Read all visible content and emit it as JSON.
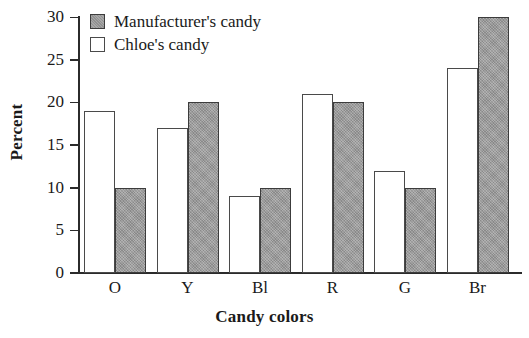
{
  "chart_data": {
    "type": "bar",
    "title": "",
    "xlabel": "Candy colors",
    "ylabel": "Percent",
    "categories": [
      "O",
      "Y",
      "Bl",
      "R",
      "G",
      "Br"
    ],
    "series": [
      {
        "name": "Manufacturer's candy",
        "values": [
          10,
          20,
          10,
          20,
          10,
          30
        ],
        "color": "#9a9a9a"
      },
      {
        "name": "Chloe's candy",
        "values": [
          19,
          17,
          9,
          21,
          12,
          24
        ],
        "color": "#ffffff"
      }
    ],
    "ylim": [
      0,
      30
    ],
    "yticks": [
      0,
      5,
      10,
      15,
      20,
      25,
      30
    ],
    "grid": false,
    "legend_position": "top-left",
    "bar_order_in_group": [
      "Chloe's candy",
      "Manufacturer's candy"
    ]
  },
  "legend": {
    "items": [
      {
        "label": "Manufacturer's candy",
        "swatch": "filled-gray-square"
      },
      {
        "label": "Chloe's candy",
        "swatch": "open-white-square"
      }
    ]
  },
  "axes": {
    "y_title": "Percent",
    "x_title": "Candy colors",
    "y_tick_labels": [
      "30",
      "25",
      "20",
      "15",
      "10",
      "5",
      "0"
    ],
    "x_tick_labels": [
      "O",
      "Y",
      "Bl",
      "R",
      "G",
      "Br"
    ]
  }
}
